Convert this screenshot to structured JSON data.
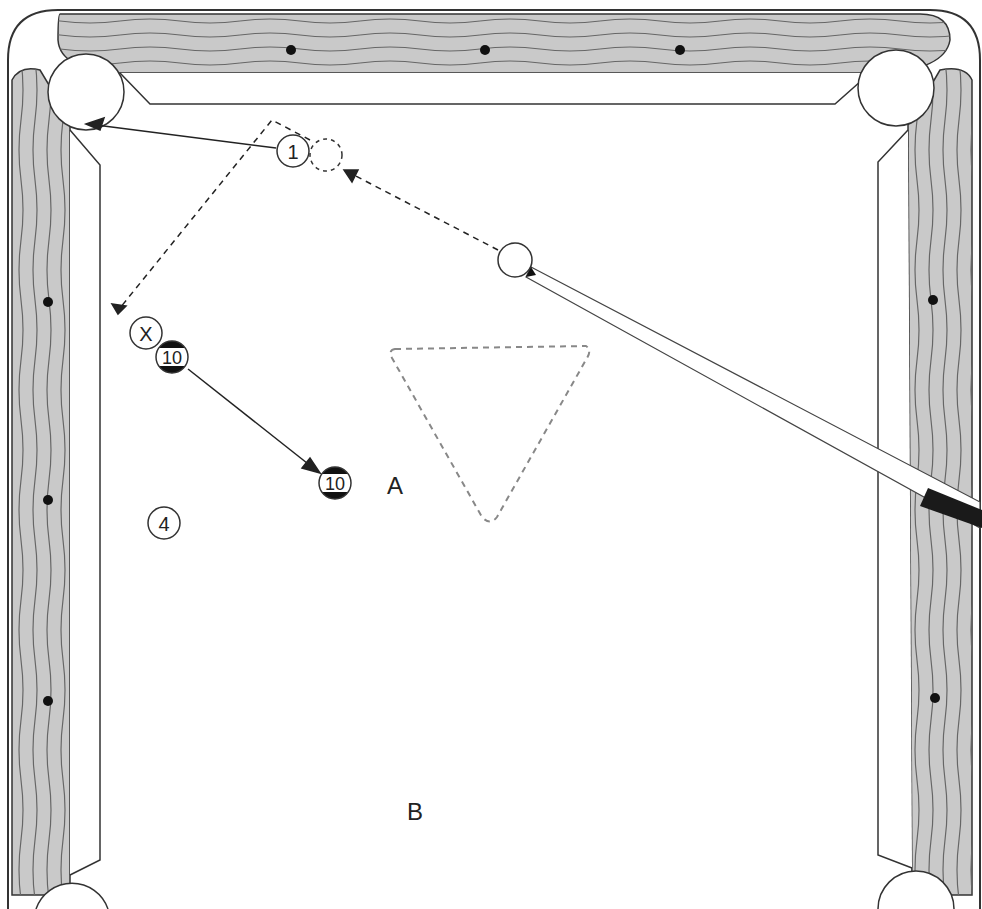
{
  "diagram": {
    "type": "billiards-shot-diagram",
    "colors": {
      "rail_wood": "#c9c9c9",
      "rail_grain": "#666666",
      "outline": "#333333",
      "felt": "#ffffff",
      "rack": "#888888",
      "cue_wrap": "#1a1a1a"
    },
    "balls": [
      {
        "id": "ball-1",
        "label": "1",
        "x": 293,
        "y": 151,
        "striped": false
      },
      {
        "id": "ghost-ball",
        "label": "",
        "x": 326,
        "y": 155,
        "ghost": true
      },
      {
        "id": "cue-ball",
        "label": "",
        "x": 515,
        "y": 260
      },
      {
        "id": "ball-x",
        "label": "X",
        "x": 146,
        "y": 333,
        "striped": false
      },
      {
        "id": "ball-10-start",
        "label": "10",
        "x": 172,
        "y": 357,
        "striped": true
      },
      {
        "id": "ball-10-end",
        "label": "10",
        "x": 335,
        "y": 483,
        "striped": true
      },
      {
        "id": "ball-4",
        "label": "4",
        "x": 164,
        "y": 523,
        "striped": false
      }
    ],
    "labels": [
      {
        "id": "label-a",
        "text": "A",
        "x": 395,
        "y": 494
      },
      {
        "id": "label-b",
        "text": "B",
        "x": 415,
        "y": 820
      }
    ],
    "paths": [
      {
        "id": "object-ball-path",
        "style": "solid",
        "from": [
          276,
          148
        ],
        "to": [
          86,
          124
        ]
      },
      {
        "id": "cue-ball-path-to-ghost",
        "style": "dashed",
        "from": [
          498,
          250
        ],
        "to": [
          344,
          170
        ]
      },
      {
        "id": "cue-ball-carom-path",
        "style": "dashed",
        "points": [
          [
            310,
            140
          ],
          [
            272,
            120
          ],
          [
            118,
            312
          ]
        ]
      },
      {
        "id": "ten-ball-path",
        "style": "solid",
        "from": [
          188,
          369
        ],
        "to": [
          318,
          472
        ]
      }
    ],
    "rack": {
      "style": "dashed-triangle",
      "points": [
        [
          392,
          349
        ],
        [
          589,
          346
        ],
        [
          490,
          522
        ]
      ]
    },
    "diamonds": {
      "top": [
        [
          291,
          50
        ],
        [
          485,
          50
        ],
        [
          680,
          50
        ]
      ],
      "left": [
        [
          48,
          302
        ],
        [
          48,
          500
        ],
        [
          48,
          701
        ]
      ],
      "right": [
        [
          933,
          300
        ],
        [
          935,
          698
        ]
      ]
    }
  }
}
